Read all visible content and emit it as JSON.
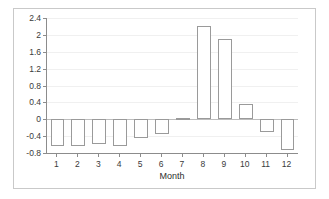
{
  "chart_data": {
    "type": "bar",
    "title": "",
    "subtitle": "",
    "xlabel": "Month",
    "ylabel": "",
    "categories": [
      "1",
      "2",
      "3",
      "4",
      "5",
      "6",
      "7",
      "8",
      "9",
      "10",
      "11",
      "12"
    ],
    "values": [
      -0.63,
      -0.63,
      -0.59,
      -0.63,
      -0.44,
      -0.35,
      0.03,
      2.2,
      1.9,
      0.35,
      -0.3,
      -0.72
    ],
    "series": [
      {
        "name": "Monthly value",
        "values": [
          -0.63,
          -0.63,
          -0.59,
          -0.63,
          -0.44,
          -0.35,
          0.03,
          2.2,
          1.9,
          0.35,
          -0.3,
          -0.72
        ]
      }
    ],
    "ylim": [
      -0.8,
      2.4
    ],
    "xlim": [
      0.5,
      12.5
    ],
    "ytick_labels": [
      "2.4",
      "2",
      "1.6",
      "1.2",
      "0.8",
      "0.4",
      "0",
      "-0.4",
      "-0.8"
    ],
    "ytick_values": [
      2.4,
      2,
      1.6,
      1.2,
      0.8,
      0.4,
      0,
      -0.4,
      -0.8
    ],
    "xtick_labels": [
      "1",
      "2",
      "3",
      "4",
      "5",
      "6",
      "7",
      "8",
      "9",
      "10",
      "11",
      "12"
    ],
    "grid": true,
    "grid_axis": "y",
    "legend": false,
    "legend_position": "none",
    "bar_fill_color": "#ffffff",
    "bar_border_color": "#9a9a9a",
    "axis_color": "#8c8c8c",
    "gridline_color": "#f0f0f0",
    "zero_line_color": "#bdbdbd",
    "frame_color": "#c9c9c9",
    "text_color": "#3a3a3a",
    "background_color": "#ffffff",
    "annotations": []
  }
}
